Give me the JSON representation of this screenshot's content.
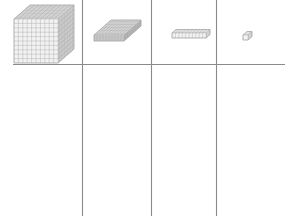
{
  "worksheet": {
    "title": "Base Ten Blocks Place Value Chart",
    "description": "Four base-ten block manipulatives arranged above a horizontal rule, separated by three vertical column dividers.",
    "background_color": "#ffffff",
    "line_color": "#8a8a8a",
    "block_stroke_color": "#9a9a9a",
    "block_face_color": "#f2f2f2",
    "block_top_color": "#e2e2e2",
    "block_side_color": "#d4d4d4"
  },
  "grid": {
    "horizontal_rule": {
      "name": "baseline-rule",
      "x1": 13,
      "y1": 64.5,
      "x2": 285,
      "y2": 64.5,
      "thickness": 1.1
    },
    "vertical_rules": [
      {
        "name": "divider-1",
        "x": 82.5,
        "y1": 0,
        "y2": 216,
        "thickness": 1.1
      },
      {
        "name": "divider-2",
        "x": 151.5,
        "y1": 0,
        "y2": 216,
        "thickness": 1.1
      },
      {
        "name": "divider-3",
        "x": 216.5,
        "y1": 0,
        "y2": 216,
        "thickness": 1.1
      }
    ]
  },
  "columns": [
    {
      "id": "thousands",
      "label": "Thousands",
      "value": 1000,
      "block": "cube",
      "answer": ""
    },
    {
      "id": "hundreds",
      "label": "Hundreds",
      "value": 100,
      "block": "flat",
      "answer": ""
    },
    {
      "id": "tens",
      "label": "Tens",
      "value": 10,
      "block": "rod",
      "answer": ""
    },
    {
      "id": "ones",
      "label": "Ones",
      "value": 1,
      "block": "unit",
      "answer": ""
    }
  ],
  "blocks": [
    {
      "id": "thousands-cube",
      "name": "thousands-cube-block",
      "shape": "cube",
      "units": 1000,
      "grid": {
        "cols": 10,
        "rows": 10,
        "layers": 10
      },
      "front": {
        "x": 14,
        "y": 19,
        "w": 44,
        "h": 44
      },
      "depth": {
        "dx": 16,
        "dy": -14
      }
    },
    {
      "id": "hundreds-flat",
      "name": "hundreds-flat-block",
      "shape": "flat",
      "units": 100,
      "grid": {
        "cols": 10,
        "rows": 10,
        "layers": 1
      },
      "front": {
        "x": 94,
        "y": 35,
        "w": 30,
        "h": 6
      },
      "depth": {
        "dx": 17,
        "dy": -15
      }
    },
    {
      "id": "tens-rod",
      "name": "tens-rod-block",
      "shape": "rod",
      "units": 10,
      "grid": {
        "cols": 10,
        "rows": 1,
        "layers": 1
      },
      "front": {
        "x": 172,
        "y": 33,
        "w": 34,
        "h": 5
      },
      "depth": {
        "dx": 4,
        "dy": -3.5
      }
    },
    {
      "id": "ones-unit",
      "name": "ones-unit-block",
      "shape": "unit",
      "units": 1,
      "grid": {
        "cols": 1,
        "rows": 1,
        "layers": 1
      },
      "front": {
        "x": 243,
        "y": 35,
        "w": 5,
        "h": 5
      },
      "depth": {
        "dx": 4,
        "dy": -3.5
      }
    }
  ]
}
